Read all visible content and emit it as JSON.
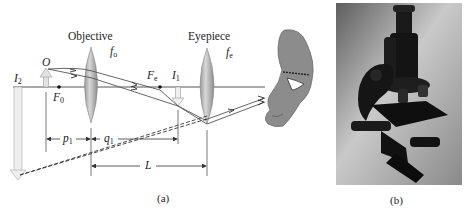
{
  "figure": {
    "panel_a": {
      "caption": "(a)",
      "lens_labels": {
        "objective": "Objective",
        "eyepiece": "Eyepiece"
      },
      "focal_labels": {
        "objective_focal": {
          "base": "f",
          "sub": "o"
        },
        "eyepiece_focal": {
          "base": "f",
          "sub": "e"
        }
      },
      "points": {
        "object": {
          "base": "O",
          "sub": ""
        },
        "final_image": {
          "base": "I",
          "sub": "2"
        },
        "objective_focal_point": {
          "base": "F",
          "sub": "0"
        },
        "eyepiece_focal_point": {
          "base": "F",
          "sub": "e"
        },
        "intermediate_image": {
          "base": "I",
          "sub": "1"
        }
      },
      "dimensions": {
        "object_distance": {
          "base": "p",
          "sub": "1"
        },
        "image_distance": {
          "base": "q",
          "sub": "1"
        },
        "lens_separation": {
          "base": "L",
          "sub": ""
        }
      },
      "colors": {
        "lens_fill": "#b8b8b8",
        "lens_edge": "#8a8a8a",
        "axis_line": "#555555",
        "ray_line": "#555555",
        "arrow_fill": "#e2e2e2",
        "eye_fill": "#8c8c8c"
      }
    },
    "panel_b": {
      "caption": "(b)",
      "photo_subject": "compound microscope photograph"
    }
  }
}
